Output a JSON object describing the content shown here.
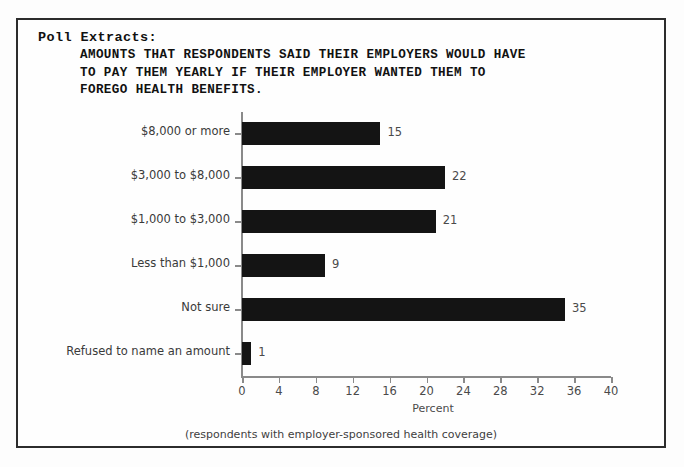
{
  "frame": {
    "border_color": "#2c2c2c",
    "background": "#fefefe"
  },
  "heading": {
    "label": "Poll Extracts:",
    "title_lines": [
      "AMOUNTS THAT RESPONDENTS SAID THEIR EMPLOYERS WOULD HAVE",
      "TO PAY THEM YEARLY IF THEIR EMPLOYER WANTED THEM TO",
      "FOREGO HEALTH BENEFITS."
    ]
  },
  "footnote": "(respondents with employer-sponsored health coverage)",
  "chart_data": {
    "type": "bar",
    "orientation": "horizontal",
    "title": "AMOUNTS THAT RESPONDENTS SAID THEIR EMPLOYERS WOULD HAVE TO PAY THEM YEARLY IF THEIR EMPLOYER WANTED THEM TO FOREGO HEALTH BENEFITS.",
    "categories": [
      "$8,000 or more",
      "$3,000 to $8,000",
      "$1,000 to $3,000",
      "Less than $1,000",
      "Not sure",
      "Refused to name an amount"
    ],
    "values": [
      15,
      22,
      21,
      9,
      35,
      1
    ],
    "data_labels": [
      "15",
      "22",
      "21",
      "9",
      "35",
      "1"
    ],
    "xlabel": "Percent",
    "ylabel": "",
    "xlim": [
      0,
      40
    ],
    "xticks": [
      0,
      4,
      8,
      12,
      16,
      20,
      24,
      28,
      32,
      36,
      40
    ],
    "xtick_labels": [
      "0",
      "4",
      "8",
      "12",
      "16",
      "20",
      "24",
      "28",
      "32",
      "36",
      "40"
    ],
    "grid": false,
    "legend": false,
    "bar_color": "#141414",
    "axis_color": "#8a8a8a",
    "note": "(respondents with employer-sponsored health coverage)"
  }
}
